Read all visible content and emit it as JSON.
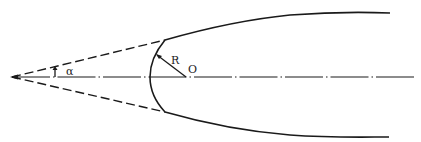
{
  "diagram": {
    "labels": {
      "angle": "α",
      "radius": "R",
      "center": "O"
    },
    "colors": {
      "line": "#1a1a1a",
      "background": "#ffffff"
    }
  }
}
